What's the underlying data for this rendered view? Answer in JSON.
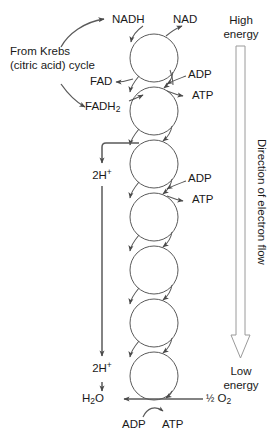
{
  "diagram": {
    "stroke_color": "#4a4a4a",
    "text_color": "#1a1a1a",
    "background": "#ffffff",
    "chain": {
      "carrier_count": 7,
      "carrier_diameter_px": 48
    },
    "labels": {
      "nadh": "NADH",
      "nad": "NAD",
      "from_krebs_line1": "From Krebs",
      "from_krebs_line2": "(citric acid) cycle",
      "fad": "FAD",
      "fadh2_prefix": "FADH",
      "fadh2_sub": "2",
      "adp_1": "ADP",
      "atp_1": "ATP",
      "adp_2": "ADP",
      "atp_2": "ATP",
      "two_h_plus_prefix_1": "2H",
      "two_h_plus_sup_1": "+",
      "two_h_plus_prefix_2": "2H",
      "two_h_plus_sup_2": "+",
      "water_prefix": "H",
      "water_sub": "2",
      "water_suffix": "O",
      "half_o2_fraction": "½",
      "half_o2_element": "O",
      "half_o2_sub": "2",
      "adp_bottom": "ADP",
      "atp_bottom": "ATP",
      "high_energy_line1": "High",
      "high_energy_line2": "energy",
      "low_energy_line1": "Low",
      "low_energy_line2": "energy",
      "direction_of_electron_flow": "Direction of electron flow"
    }
  }
}
